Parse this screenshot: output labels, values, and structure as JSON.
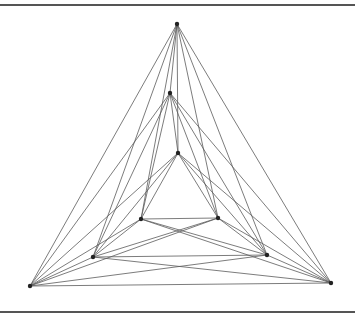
{
  "diagram": {
    "type": "graph",
    "edge_color": "#5a5a5a",
    "vertex_color": "#222222",
    "vertices": [
      {
        "id": "A1",
        "layer": "outer",
        "x": 177,
        "y": 24
      },
      {
        "id": "B1",
        "layer": "outer",
        "x": 30,
        "y": 286
      },
      {
        "id": "C1",
        "layer": "outer",
        "x": 331,
        "y": 283
      },
      {
        "id": "A2",
        "layer": "middle",
        "x": 170,
        "y": 93
      },
      {
        "id": "B2",
        "layer": "middle",
        "x": 93,
        "y": 257
      },
      {
        "id": "C2",
        "layer": "middle",
        "x": 267,
        "y": 255
      },
      {
        "id": "A3",
        "layer": "inner",
        "x": 178,
        "y": 153
      },
      {
        "id": "B3",
        "layer": "inner",
        "x": 141,
        "y": 219
      },
      {
        "id": "C3",
        "layer": "inner",
        "x": 218,
        "y": 218
      }
    ],
    "edges": [
      [
        "A1",
        "B1"
      ],
      [
        "A1",
        "C1"
      ],
      [
        "A1",
        "A2"
      ],
      [
        "A1",
        "B2"
      ],
      [
        "A1",
        "C2"
      ],
      [
        "A1",
        "A3"
      ],
      [
        "A1",
        "B3"
      ],
      [
        "A1",
        "C3"
      ],
      [
        "B1",
        "C1"
      ],
      [
        "B1",
        "A2"
      ],
      [
        "B1",
        "B2"
      ],
      [
        "B1",
        "C2"
      ],
      [
        "B1",
        "A3"
      ],
      [
        "B1",
        "B3"
      ],
      [
        "B1",
        "C3"
      ],
      [
        "C1",
        "A2"
      ],
      [
        "C1",
        "B2"
      ],
      [
        "C1",
        "C2"
      ],
      [
        "C1",
        "A3"
      ],
      [
        "C1",
        "B3"
      ],
      [
        "C1",
        "C3"
      ],
      [
        "A2",
        "B2"
      ],
      [
        "A2",
        "C2"
      ],
      [
        "A2",
        "A3"
      ],
      [
        "A2",
        "B3"
      ],
      [
        "A2",
        "C3"
      ],
      [
        "B2",
        "C2"
      ],
      [
        "B2",
        "A3"
      ],
      [
        "B2",
        "B3"
      ],
      [
        "B2",
        "C3"
      ],
      [
        "C2",
        "A3"
      ],
      [
        "C2",
        "B3"
      ],
      [
        "C2",
        "C3"
      ],
      [
        "A3",
        "B3"
      ],
      [
        "A3",
        "C3"
      ],
      [
        "B3",
        "C3"
      ]
    ]
  }
}
